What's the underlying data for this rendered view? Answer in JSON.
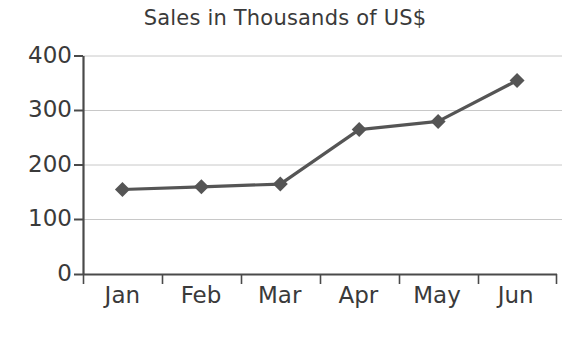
{
  "chart_data": {
    "type": "line",
    "title": "Sales in Thousands of US$",
    "xlabel": "",
    "ylabel": "",
    "categories": [
      "Jan",
      "Feb",
      "Mar",
      "Apr",
      "May",
      "Jun"
    ],
    "values": [
      155,
      160,
      165,
      265,
      280,
      355
    ],
    "series": [
      {
        "name": "Sales",
        "values": [
          155,
          160,
          165,
          265,
          280,
          355
        ]
      }
    ],
    "ylim": [
      0,
      400
    ],
    "yticks": [
      0,
      100,
      200,
      300,
      400
    ],
    "ytick_labels": [
      "0",
      "100",
      "200",
      "300",
      "400"
    ],
    "grid": true,
    "grid_axis": "y",
    "legend": false,
    "legend_position": "none",
    "marker": "diamond",
    "line_color": "#555555",
    "marker_color": "#555555",
    "grid_color": "#c8c8c8",
    "axis_color": "#4a4a4a",
    "text_color": "#3a3a3a",
    "background": "#ffffff"
  },
  "axes": {
    "y_axis_name": "y-axis",
    "x_axis_name": "x-axis"
  }
}
